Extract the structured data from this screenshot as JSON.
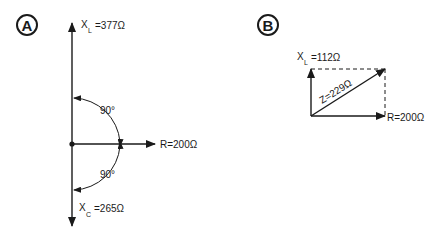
{
  "diagram_a": {
    "panel_label": "A",
    "xl_label": {
      "main": "X",
      "sub": "L",
      "value": "=377Ω"
    },
    "r_label": "R=200Ω",
    "xc_label": {
      "main": "X",
      "sub": "C",
      "value": "=265Ω"
    },
    "angle_top": "90°",
    "angle_bottom": "90°"
  },
  "diagram_b": {
    "panel_label": "B",
    "xl_label": {
      "main": "X",
      "sub": "L",
      "value": "=112Ω"
    },
    "z_label": "Z=229Ω",
    "r_label": "R=200Ω"
  },
  "colors": {
    "ink": "#1a1a1a",
    "background": "#ffffff"
  }
}
